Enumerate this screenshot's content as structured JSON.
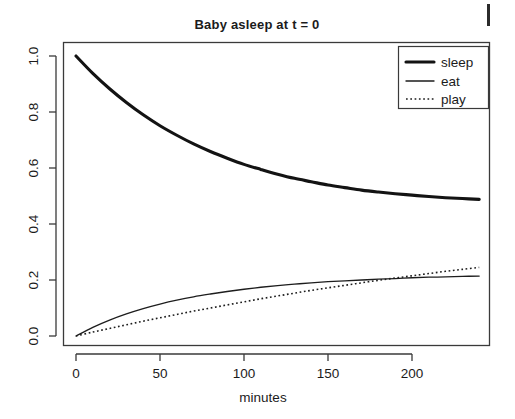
{
  "chart_data": {
    "type": "line",
    "title": "Baby asleep at t = 0",
    "xlabel": "minutes",
    "ylabel": "",
    "xlim": [
      -6,
      248
    ],
    "ylim": [
      -0.03,
      1.03
    ],
    "xticks": [
      0,
      50,
      100,
      150,
      200
    ],
    "xticklabels": [
      "0",
      "50",
      "100",
      "150",
      "200"
    ],
    "yticks": [
      0.0,
      0.2,
      0.4,
      0.6,
      0.8,
      1.0
    ],
    "yticklabels": [
      "0.0",
      "0.2",
      "0.4",
      "0.6",
      "0.8",
      "1.0"
    ],
    "grid": false,
    "legend_position": "top-right",
    "x": [
      0,
      10,
      20,
      30,
      40,
      50,
      60,
      70,
      80,
      90,
      100,
      110,
      120,
      130,
      140,
      150,
      160,
      170,
      180,
      190,
      200,
      210,
      220,
      230,
      240
    ],
    "series": [
      {
        "name": "sleep",
        "style": "solid-thick",
        "values": [
          1.0,
          0.938,
          0.883,
          0.834,
          0.79,
          0.751,
          0.717,
          0.686,
          0.659,
          0.635,
          0.613,
          0.595,
          0.578,
          0.563,
          0.551,
          0.539,
          0.53,
          0.521,
          0.514,
          0.508,
          0.503,
          0.498,
          0.494,
          0.491,
          0.488
        ]
      },
      {
        "name": "eat",
        "style": "solid-thin",
        "values": [
          0.0,
          0.031,
          0.057,
          0.079,
          0.098,
          0.114,
          0.128,
          0.14,
          0.15,
          0.159,
          0.167,
          0.174,
          0.18,
          0.185,
          0.19,
          0.194,
          0.197,
          0.2,
          0.203,
          0.205,
          0.208,
          0.21,
          0.211,
          0.213,
          0.214
        ]
      },
      {
        "name": "play",
        "style": "dotted",
        "values": [
          0.0,
          0.014,
          0.027,
          0.04,
          0.053,
          0.065,
          0.077,
          0.089,
          0.1,
          0.111,
          0.122,
          0.133,
          0.143,
          0.153,
          0.163,
          0.172,
          0.181,
          0.19,
          0.199,
          0.207,
          0.215,
          0.223,
          0.231,
          0.238,
          0.245
        ]
      }
    ],
    "legend_entries": [
      {
        "label": "sleep",
        "style": "solid-thick"
      },
      {
        "label": "eat",
        "style": "solid-thin"
      },
      {
        "label": "play",
        "style": "dotted"
      }
    ],
    "colors": {
      "line": "#131313",
      "axis": "#3a3a3a",
      "text": "#1b1b1b",
      "background": "#ffffff"
    }
  }
}
